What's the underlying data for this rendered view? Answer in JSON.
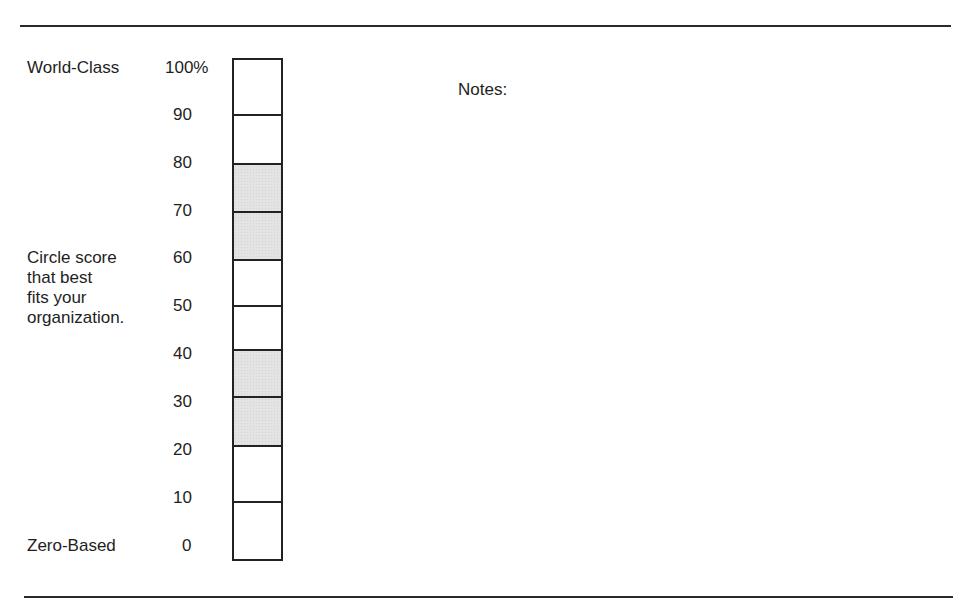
{
  "top_label": "World-Class",
  "bottom_label": "Zero-Based",
  "instruction": {
    "lines": [
      "Circle score",
      "that best",
      "fits your",
      "organization."
    ]
  },
  "scale": {
    "ticks": [
      "100%",
      "90",
      "80",
      "70",
      "60",
      "50",
      "40",
      "30",
      "20",
      "10",
      "0"
    ],
    "cells": [
      {
        "range": "100-90",
        "shaded": false
      },
      {
        "range": "90-80",
        "shaded": false
      },
      {
        "range": "80-70",
        "shaded": true
      },
      {
        "range": "70-60",
        "shaded": true
      },
      {
        "range": "60-50",
        "shaded": false
      },
      {
        "range": "50-40",
        "shaded": false
      },
      {
        "range": "40-30",
        "shaded": true
      },
      {
        "range": "30-20",
        "shaded": true
      },
      {
        "range": "20-10",
        "shaded": false
      },
      {
        "range": "10-0",
        "shaded": false
      }
    ],
    "shade_color": "#e3e3e3",
    "border_color": "#222222"
  },
  "notes": {
    "label": "Notes:"
  }
}
